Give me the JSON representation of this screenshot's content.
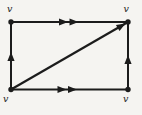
{
  "diagram": {
    "background": "#f5f4f1",
    "ink": "#1c1c1c",
    "vertices": [
      {
        "position": "top-left",
        "label": "v"
      },
      {
        "position": "top-right",
        "label": "v"
      },
      {
        "position": "bottom-left",
        "label": "v"
      },
      {
        "position": "bottom-right",
        "label": "v"
      }
    ],
    "edges": [
      {
        "from": "top-left",
        "to": "top-right",
        "arrowheads": 2,
        "direction": "right"
      },
      {
        "from": "bottom-left",
        "to": "bottom-right",
        "arrowheads": 2,
        "direction": "right"
      },
      {
        "from": "bottom-left",
        "to": "top-left",
        "arrowheads": 1,
        "direction": "up"
      },
      {
        "from": "bottom-right",
        "to": "top-right",
        "arrowheads": 1,
        "direction": "up"
      },
      {
        "from": "bottom-left",
        "to": "top-right",
        "arrowheads": 1,
        "direction": "up-right",
        "type": "diagonal"
      }
    ]
  }
}
